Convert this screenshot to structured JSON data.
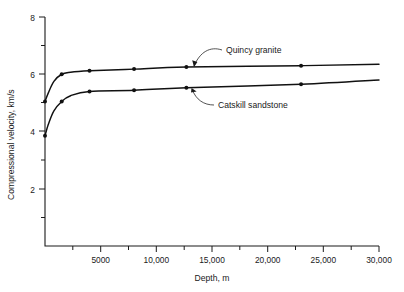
{
  "chart_data": {
    "type": "line",
    "title": "",
    "xlabel": "Depth, m",
    "ylabel": "Compressional velocity, km/s",
    "xlim": [
      0,
      30000
    ],
    "ylim": [
      0,
      8
    ],
    "grid": false,
    "legend_position": "inline-annotations",
    "x_ticklabels": [
      "5000",
      "10,000",
      "15,000",
      "20,000",
      "25,000",
      "30,000"
    ],
    "x_tickvalues": [
      5000,
      10000,
      15000,
      20000,
      25000,
      30000
    ],
    "x_minor_tickvalues": [
      2500,
      7500,
      12500,
      17500,
      22500,
      27500
    ],
    "y_ticklabels": [
      "2",
      "4",
      "6",
      "8"
    ],
    "y_tickvalues": [
      2,
      4,
      6,
      8
    ],
    "y_minor_tickvalues": [
      1,
      3,
      5,
      7
    ],
    "series": [
      {
        "name": "Quincy granite",
        "annotation": "Quincy granite",
        "x": [
          0,
          300,
          800,
          1500,
          2300,
          4000,
          8000,
          12700,
          23000,
          30000
        ],
        "y": [
          5.05,
          5.35,
          5.75,
          6.0,
          6.07,
          6.12,
          6.18,
          6.25,
          6.3,
          6.35
        ],
        "marker_x": [
          0,
          1500,
          4000,
          8000,
          12700,
          23000
        ],
        "marker_y": [
          5.05,
          6.0,
          6.12,
          6.18,
          6.25,
          6.3
        ]
      },
      {
        "name": "Catskill sandstone",
        "annotation": "Catskill sandstone",
        "x": [
          0,
          300,
          800,
          1500,
          2300,
          4000,
          8000,
          12700,
          23000,
          30000
        ],
        "y": [
          3.85,
          4.25,
          4.72,
          5.05,
          5.25,
          5.4,
          5.44,
          5.53,
          5.65,
          5.8
        ],
        "marker_x": [
          0,
          1500,
          4000,
          8000,
          12700,
          23000
        ],
        "marker_y": [
          3.85,
          5.05,
          5.4,
          5.44,
          5.53,
          5.65
        ]
      }
    ],
    "colors": {
      "axis": "#1a1a1a",
      "curve": "#111111",
      "background": "#ffffff"
    }
  },
  "labels": {
    "x_axis_title": "Depth, m",
    "y_axis_title": "Compressional velocity, km/s",
    "x_tick_5000": "5000",
    "x_tick_10000": "10,000",
    "x_tick_15000": "15,000",
    "x_tick_20000": "20,000",
    "x_tick_25000": "25,000",
    "x_tick_30000": "30,000",
    "y_tick_2": "2",
    "y_tick_4": "4",
    "y_tick_6": "6",
    "y_tick_8": "8",
    "annotation_upper": "Quincy granite",
    "annotation_lower": "Catskill sandstone"
  }
}
